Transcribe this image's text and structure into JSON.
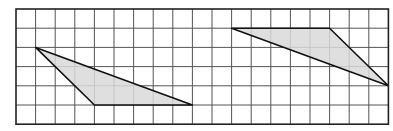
{
  "diagram": {
    "type": "grid-with-triangles",
    "grid": {
      "columns": 19,
      "rows": 6,
      "origin_px": [
        16,
        9
      ],
      "cell_px": [
        19.6,
        19.2
      ],
      "line_color": "#555555",
      "border_color": "#222222"
    },
    "shapes": [
      {
        "name": "left-triangle",
        "vertices": [
          [
            1,
            2
          ],
          [
            4,
            5
          ],
          [
            9,
            5
          ]
        ],
        "fill": "#d9d9d9",
        "stroke": "#111111"
      },
      {
        "name": "right-triangle",
        "vertices": [
          [
            11,
            1
          ],
          [
            16,
            1
          ],
          [
            19,
            4
          ]
        ],
        "fill": "#d9d9d9",
        "stroke": "#111111"
      }
    ]
  }
}
